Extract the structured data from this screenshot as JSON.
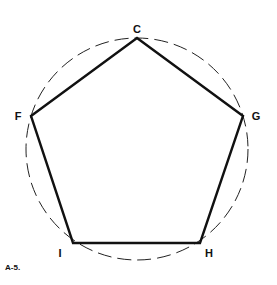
{
  "figure": {
    "caption": "A-5.",
    "circle": {
      "cx": 137,
      "cy": 149,
      "r": 111,
      "style": "dashed"
    },
    "vertices": [
      {
        "label": "C",
        "x": 137,
        "y": 38,
        "lx": 137,
        "ly": 34
      },
      {
        "label": "G",
        "x": 243,
        "y": 116,
        "lx": 256,
        "ly": 120
      },
      {
        "label": "H",
        "x": 200,
        "y": 243,
        "lx": 209,
        "ly": 256
      },
      {
        "label": "I",
        "x": 73,
        "y": 243,
        "lx": 60,
        "ly": 256
      },
      {
        "label": "F",
        "x": 31,
        "y": 116,
        "lx": 18,
        "ly": 120
      }
    ]
  }
}
